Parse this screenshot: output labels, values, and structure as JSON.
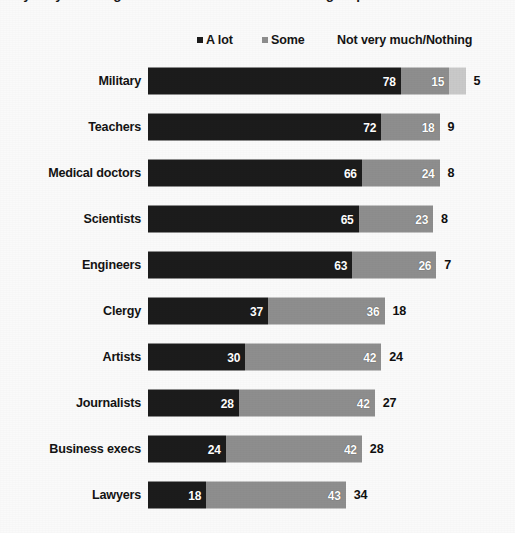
{
  "title": {
    "text": "say they have a great deal of confidence in each group",
    "cropped": true
  },
  "legend": {
    "position": "top",
    "items": [
      {
        "label": "A lot",
        "color": "#1c1c1c",
        "has_swatch": true
      },
      {
        "label": "Some",
        "color": "#8e8e8e",
        "has_swatch": true
      },
      {
        "label": "Not very much/Nothing",
        "color": "#c9c9c9",
        "has_swatch": false
      }
    ]
  },
  "chart_data": {
    "type": "bar",
    "orientation": "horizontal",
    "stacked": true,
    "title": "say they have a great deal of confidence in each group",
    "xlabel": "",
    "ylabel": "",
    "xlim": [
      0,
      100
    ],
    "grid": false,
    "legend_position": "top",
    "categories": [
      "Military",
      "Teachers",
      "Medical doctors",
      "Scientists",
      "Engineers",
      "Clergy",
      "Artists",
      "Journalists",
      "Business execs",
      "Lawyers"
    ],
    "series": [
      {
        "name": "A lot",
        "color": "#1c1c1c",
        "values": [
          78,
          72,
          66,
          65,
          63,
          37,
          30,
          28,
          24,
          18
        ]
      },
      {
        "name": "Some",
        "color": "#8e8e8e",
        "values": [
          15,
          18,
          24,
          23,
          26,
          36,
          42,
          42,
          42,
          43
        ]
      },
      {
        "name": "Not very much/Nothing",
        "color": "#c9c9c9",
        "values": [
          5,
          9,
          8,
          8,
          7,
          18,
          24,
          27,
          28,
          34
        ]
      }
    ]
  },
  "rows": [
    {
      "label": "Military",
      "a_lot": 78,
      "some": 15,
      "not_much": 5,
      "a_lot_text": "78",
      "some_text": "15",
      "not_much_text": "5",
      "not_much_inside": true
    },
    {
      "label": "Teachers",
      "a_lot": 72,
      "some": 18,
      "not_much": 9,
      "a_lot_text": "72",
      "some_text": "18",
      "not_much_text": "9",
      "not_much_inside": false
    },
    {
      "label": "Medical doctors",
      "a_lot": 66,
      "some": 24,
      "not_much": 8,
      "a_lot_text": "66",
      "some_text": "24",
      "not_much_text": "8",
      "not_much_inside": false
    },
    {
      "label": "Scientists",
      "a_lot": 65,
      "some": 23,
      "not_much": 8,
      "a_lot_text": "65",
      "some_text": "23",
      "not_much_text": "8",
      "not_much_inside": false
    },
    {
      "label": "Engineers",
      "a_lot": 63,
      "some": 26,
      "not_much": 7,
      "a_lot_text": "63",
      "some_text": "26",
      "not_much_text": "7",
      "not_much_inside": false
    },
    {
      "label": "Clergy",
      "a_lot": 37,
      "some": 36,
      "not_much": 18,
      "a_lot_text": "37",
      "some_text": "36",
      "not_much_text": "18",
      "not_much_inside": false
    },
    {
      "label": "Artists",
      "a_lot": 30,
      "some": 42,
      "not_much": 24,
      "a_lot_text": "30",
      "some_text": "42",
      "not_much_text": "24",
      "not_much_inside": false
    },
    {
      "label": "Journalists",
      "a_lot": 28,
      "some": 42,
      "not_much": 27,
      "a_lot_text": "28",
      "some_text": "42",
      "not_much_text": "27",
      "not_much_inside": false
    },
    {
      "label": "Business execs",
      "a_lot": 24,
      "some": 42,
      "not_much": 28,
      "a_lot_text": "24",
      "some_text": "42",
      "not_much_text": "28",
      "not_much_inside": false
    },
    {
      "label": "Lawyers",
      "a_lot": 18,
      "some": 43,
      "not_much": 34,
      "a_lot_text": "18",
      "some_text": "43",
      "not_much_text": "34",
      "not_much_inside": false
    }
  ]
}
